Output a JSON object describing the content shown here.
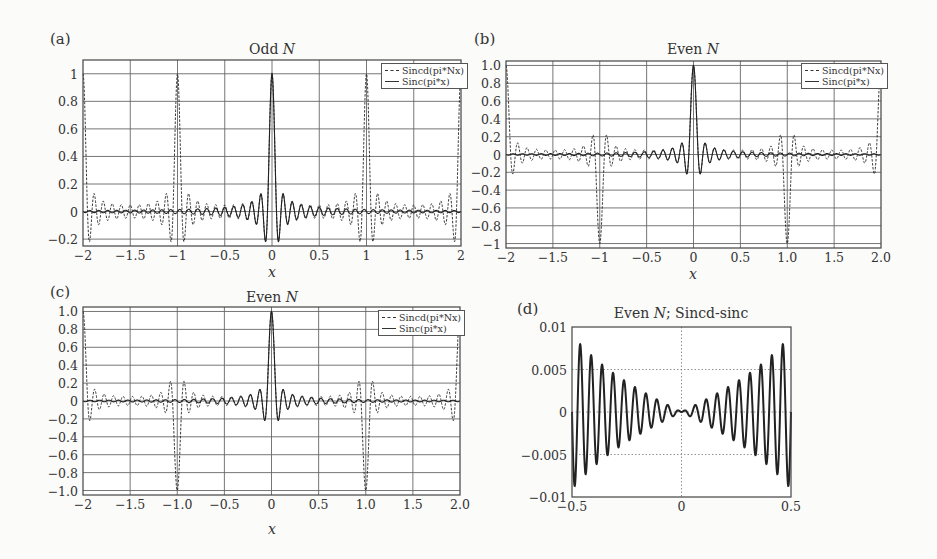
{
  "figure": {
    "panels": [
      {
        "id": "a",
        "label": "(a)",
        "title": "Odd N",
        "title_plain": "Odd ",
        "title_italic": "N",
        "title_rest": "",
        "xlabel": "x",
        "legend": [
          "Sincd(pi*Nx)",
          "Sinc(pi*x)"
        ]
      },
      {
        "id": "b",
        "label": "(b)",
        "title": "Even N",
        "title_plain": "Even ",
        "title_italic": "N",
        "title_rest": "",
        "xlabel": "x",
        "legend": [
          "Sincd(pi*Nx)",
          "Sinc(pi*x)"
        ]
      },
      {
        "id": "c",
        "label": "(c)",
        "title": "Even N",
        "title_plain": "Even ",
        "title_italic": "N",
        "title_rest": "",
        "xlabel": "x",
        "legend": [
          "Sincd(pi*Nx)",
          "Sinc(pi*x)"
        ]
      },
      {
        "id": "d",
        "label": "(d)",
        "title": "Even N; Sincd-sinc",
        "title_plain": "Even ",
        "title_italic": "N",
        "title_rest": "; Sincd-sinc",
        "xlabel": "",
        "legend": []
      }
    ]
  },
  "chart_data": [
    {
      "panel": "a",
      "type": "line",
      "title": "Odd N",
      "xlabel": "x",
      "ylabel": "",
      "xlim": [
        -2,
        2
      ],
      "ylim": [
        -0.25,
        1.1
      ],
      "xticks": [
        -2,
        -1.5,
        -1,
        -0.5,
        0,
        0.5,
        1,
        1.5,
        2
      ],
      "xtick_labels": [
        "−2",
        "−1.5",
        "−1",
        "−0.5",
        "0",
        "0.5",
        "1",
        "1.5",
        "2"
      ],
      "yticks": [
        -0.2,
        0,
        0.2,
        0.4,
        0.6,
        0.8,
        1
      ],
      "ytick_labels": [
        "−0.2",
        "0",
        "0.2",
        "0.4",
        "0.6",
        "0.8",
        "1"
      ],
      "grid": true,
      "legend_position": "upper right",
      "series": [
        {
          "name": "Sincd(pi*Nx)",
          "style": "dashed",
          "function": "sin(pi*N*x)/(N*sin(pi*x))",
          "N": 21,
          "peaks": [
            {
              "x": -2,
              "y": 1
            },
            {
              "x": -1,
              "y": 1
            },
            {
              "x": 0,
              "y": 1
            },
            {
              "x": 1,
              "y": 1
            },
            {
              "x": 2,
              "y": 1
            }
          ]
        },
        {
          "name": "Sinc(pi*x)",
          "style": "solid",
          "function": "sin(pi*N*x)/(pi*N*x)",
          "N": 21,
          "peaks": [
            {
              "x": 0,
              "y": 1
            }
          ]
        }
      ]
    },
    {
      "panel": "b",
      "type": "line",
      "title": "Even N",
      "xlabel": "x",
      "ylabel": "",
      "xlim": [
        -2,
        2
      ],
      "ylim": [
        -1.05,
        1.05
      ],
      "xticks": [
        -2,
        -1.5,
        -1,
        -0.5,
        0,
        0.5,
        1,
        1.5,
        2
      ],
      "xtick_labels": [
        "−2",
        "−1.5",
        "−1",
        "−0.5",
        "0",
        "0.5",
        "1.0",
        "1.5",
        "2.0"
      ],
      "yticks": [
        -1,
        -0.8,
        -0.6,
        -0.4,
        -0.2,
        0,
        0.2,
        0.4,
        0.6,
        0.8,
        1
      ],
      "ytick_labels": [
        "−1",
        "−0.8",
        "−0.6",
        "−0.4",
        "−0.2",
        "0",
        "0.2",
        "0.4",
        "0.6",
        "0.8",
        "1.0"
      ],
      "grid": true,
      "legend_position": "upper right",
      "series": [
        {
          "name": "Sincd(pi*Nx)",
          "style": "dashed",
          "function": "sin(pi*N*x)/(N*sin(pi*x))",
          "N": 20,
          "peaks": [
            {
              "x": -2,
              "y": 1
            },
            {
              "x": -1,
              "y": -1
            },
            {
              "x": 0,
              "y": 1
            },
            {
              "x": 1,
              "y": -1
            },
            {
              "x": 2,
              "y": 1
            }
          ]
        },
        {
          "name": "Sinc(pi*x)",
          "style": "solid",
          "function": "sin(pi*N*x)/(pi*N*x)",
          "N": 20,
          "peaks": [
            {
              "x": 0,
              "y": 1
            }
          ]
        }
      ]
    },
    {
      "panel": "c",
      "type": "line",
      "title": "Even N",
      "xlabel": "x",
      "ylabel": "",
      "xlim": [
        -2,
        2
      ],
      "ylim": [
        -1.05,
        1.05
      ],
      "xticks": [
        -2,
        -1.5,
        -1,
        -0.5,
        0,
        0.5,
        1,
        1.5,
        2
      ],
      "xtick_labels": [
        "−2",
        "−1.5",
        "−1.0",
        "−0.5",
        "0",
        "0.5",
        "1.0",
        "1.5",
        "2.0"
      ],
      "yticks": [
        -1,
        -0.8,
        -0.6,
        -0.4,
        -0.2,
        0,
        0.2,
        0.4,
        0.6,
        0.8,
        1
      ],
      "ytick_labels": [
        "−1.0",
        "−0.8",
        "−0.6",
        "−0.4",
        "−0.2",
        "0",
        "0.2",
        "0.4",
        "0.6",
        "0.8",
        "1.0"
      ],
      "grid": true,
      "legend_position": "upper right",
      "series": [
        {
          "name": "Sincd(pi*Nx)",
          "style": "dashed",
          "function": "sin(pi*N*x)/(N*sin(pi*x))",
          "N": 20,
          "peaks": [
            {
              "x": -2,
              "y": 1
            },
            {
              "x": -1,
              "y": -1
            },
            {
              "x": 0,
              "y": 1
            },
            {
              "x": 1,
              "y": -1
            },
            {
              "x": 2,
              "y": 1
            }
          ]
        },
        {
          "name": "Sinc(pi*x)",
          "style": "solid",
          "function": "sin(pi*N*x)/(pi*N*x)",
          "N": 20,
          "peaks": [
            {
              "x": 0,
              "y": 1
            }
          ]
        }
      ]
    },
    {
      "panel": "d",
      "type": "line",
      "title": "Even N; Sincd-sinc",
      "xlabel": "",
      "ylabel": "",
      "xlim": [
        -0.5,
        0.5
      ],
      "ylim": [
        -0.01,
        0.01
      ],
      "xticks": [
        -0.5,
        0,
        0.5
      ],
      "xtick_labels": [
        "−0.5",
        "0",
        "0.5"
      ],
      "yticks": [
        -0.01,
        -0.005,
        0,
        0.005,
        0.01
      ],
      "ytick_labels": [
        "−0.01",
        "−0.005",
        "0",
        "0.005",
        "0.01"
      ],
      "grid": "dotted",
      "legend_position": "none",
      "series": [
        {
          "name": "Sincd-sinc",
          "style": "solid",
          "function": "sin(pi*N*x)/(N*sin(pi*x)) - sin(pi*N*x)/(pi*N*x)",
          "N": 40,
          "envelope_at_edges": 0.0085,
          "value_at_0": 0
        }
      ]
    }
  ]
}
